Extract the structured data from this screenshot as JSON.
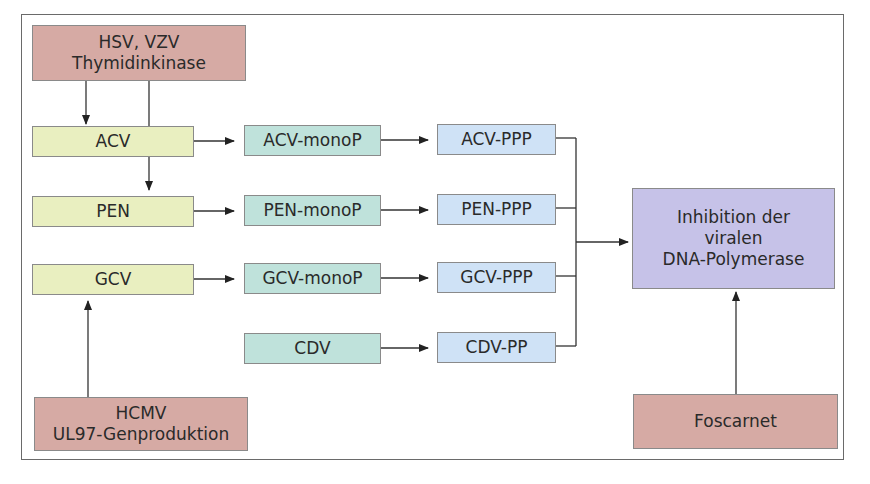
{
  "diagram": {
    "colors": {
      "enzyme": "#d6aaa4",
      "prodrug": "#e9efc0",
      "monophosphate": "#bfe2db",
      "triphosphate": "#cfe2f6",
      "target": "#c6c2e8"
    },
    "nodes": {
      "hsv_tk": {
        "line1": "HSV, VZV",
        "line2": "Thymidinkinase"
      },
      "acv": "ACV",
      "pen": "PEN",
      "gcv": "GCV",
      "hcmv": {
        "line1": "HCMV",
        "line2": "UL97-Genproduktion"
      },
      "acv_mono": "ACV-monoP",
      "pen_mono": "PEN-monoP",
      "gcv_mono": "GCV-monoP",
      "cdv": "CDV",
      "acv_ppp": "ACV-PPP",
      "pen_ppp": "PEN-PPP",
      "gcv_ppp": "GCV-PPP",
      "cdv_pp": "CDV-PP",
      "inhibition": {
        "line1": "Inhibition der",
        "line2": "viralen",
        "line3": "DNA-Polymerase"
      },
      "foscarnet": "Foscarnet"
    },
    "edges": [
      [
        "hsv_tk",
        "acv"
      ],
      [
        "hsv_tk",
        "pen"
      ],
      [
        "hcmv",
        "gcv"
      ],
      [
        "acv",
        "acv_mono"
      ],
      [
        "pen",
        "pen_mono"
      ],
      [
        "gcv",
        "gcv_mono"
      ],
      [
        "acv_mono",
        "acv_ppp"
      ],
      [
        "pen_mono",
        "pen_ppp"
      ],
      [
        "gcv_mono",
        "gcv_ppp"
      ],
      [
        "cdv",
        "cdv_pp"
      ],
      [
        "acv_ppp",
        "inhibition"
      ],
      [
        "pen_ppp",
        "inhibition"
      ],
      [
        "gcv_ppp",
        "inhibition"
      ],
      [
        "cdv_pp",
        "inhibition"
      ],
      [
        "foscarnet",
        "inhibition"
      ]
    ]
  }
}
